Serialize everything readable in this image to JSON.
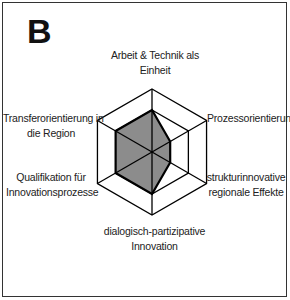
{
  "panel": {
    "letter": "B"
  },
  "chart_data": {
    "type": "radar",
    "title": "B",
    "axes": [
      "Arbeit & Technik als Einheit",
      "Prozessorientierung",
      "strukturinnovative regionale Effekte",
      "dialogisch-partizipative Innovation",
      "Qualifikation für Innovationsprozesse",
      "Transferorientierung in die Region"
    ],
    "rings": [
      2,
      3
    ],
    "range": [
      0,
      3
    ],
    "series": [
      {
        "name": "B",
        "values": [
          2,
          1,
          1,
          2,
          2,
          2
        ],
        "fill": "#8c8c8c",
        "stroke": "#000000"
      }
    ],
    "grid": true,
    "legend": "none"
  },
  "labels": {
    "top": {
      "line1": "Arbeit & Technik als",
      "line2": "Einheit"
    },
    "upper_right": {
      "line1": "Prozessorientierung"
    },
    "lower_right": {
      "line1": "strukturinnovative",
      "line2": "regionale Effekte"
    },
    "bottom": {
      "line1": "dialogisch-partizipative",
      "line2": "Innovation"
    },
    "lower_left": {
      "line1": "Qualifikation für",
      "line2": "Innovationsprozesse"
    },
    "upper_left": {
      "line1": "Transferorientierung in",
      "line2": "die Region"
    }
  }
}
